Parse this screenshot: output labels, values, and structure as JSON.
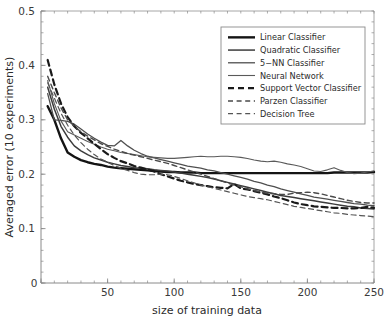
{
  "chart_data": {
    "type": "line",
    "title": "",
    "xlabel": "size of training data",
    "ylabel": "Averaged error (10 experiments)",
    "xlim": [
      0,
      250
    ],
    "ylim": [
      0,
      0.5
    ],
    "xticks": [
      0,
      50,
      100,
      150,
      200,
      250
    ],
    "xticklabels": [
      "0",
      "50",
      "100",
      "150",
      "200",
      "250"
    ],
    "yticks": [
      0,
      0.1,
      0.2,
      0.3,
      0.4,
      0.5
    ],
    "yticklabels": [
      "0",
      "0.1",
      "0.2",
      "0.3",
      "0.4",
      "0.5"
    ],
    "xminor_step": 10,
    "yminor_step": 0.02,
    "grid": false,
    "legend_position": "upper right",
    "colors": {
      "ink": "#1a1a1a",
      "mid_gray": "#4d4d4d",
      "light_gray": "#6e6e6e",
      "frame": "#8a8a8a",
      "background": "#ffffff"
    },
    "x": [
      5,
      10,
      15,
      20,
      25,
      30,
      35,
      40,
      45,
      50,
      55,
      60,
      65,
      70,
      75,
      80,
      85,
      90,
      95,
      100,
      105,
      110,
      115,
      120,
      125,
      130,
      135,
      140,
      145,
      150,
      155,
      160,
      165,
      170,
      175,
      180,
      185,
      190,
      195,
      200,
      205,
      210,
      215,
      220,
      225,
      230,
      235,
      240,
      245,
      250
    ],
    "series": [
      {
        "name": "Linear Classifier",
        "style": "solid",
        "width": 2.4,
        "color": "#141414",
        "values": [
          0.325,
          0.3,
          0.266,
          0.24,
          0.232,
          0.226,
          0.222,
          0.219,
          0.217,
          0.214,
          0.212,
          0.211,
          0.21,
          0.209,
          0.208,
          0.207,
          0.206,
          0.205,
          0.204,
          0.204,
          0.203,
          0.203,
          0.203,
          0.202,
          0.202,
          0.202,
          0.202,
          0.202,
          0.202,
          0.202,
          0.202,
          0.202,
          0.202,
          0.202,
          0.202,
          0.202,
          0.202,
          0.202,
          0.202,
          0.202,
          0.202,
          0.202,
          0.202,
          0.203,
          0.203,
          0.203,
          0.203,
          0.203,
          0.203,
          0.204
        ]
      },
      {
        "name": "Quadratic Classifier",
        "style": "solid",
        "width": 1.5,
        "color": "#3c3c3c",
        "values": [
          0.36,
          0.32,
          0.288,
          0.268,
          0.252,
          0.243,
          0.236,
          0.23,
          0.226,
          0.222,
          0.219,
          0.216,
          0.214,
          0.212,
          0.211,
          0.21,
          0.208,
          0.207,
          0.206,
          0.204,
          0.202,
          0.2,
          0.198,
          0.196,
          0.194,
          0.191,
          0.188,
          0.185,
          0.182,
          0.179,
          0.176,
          0.173,
          0.17,
          0.167,
          0.164,
          0.161,
          0.159,
          0.157,
          0.155,
          0.153,
          0.151,
          0.149,
          0.147,
          0.145,
          0.143,
          0.141,
          0.14,
          0.138,
          0.137,
          0.136
        ]
      },
      {
        "name": "5-NN Classifier",
        "style": "solid",
        "width": 1.3,
        "color": "#4f4f4f",
        "values": [
          0.348,
          0.3,
          0.299,
          0.297,
          0.292,
          0.283,
          0.274,
          0.266,
          0.259,
          0.253,
          0.252,
          0.262,
          0.252,
          0.244,
          0.238,
          0.233,
          0.23,
          0.227,
          0.224,
          0.221,
          0.218,
          0.215,
          0.213,
          0.211,
          0.208,
          0.206,
          0.203,
          0.2,
          0.197,
          0.194,
          0.191,
          0.187,
          0.184,
          0.18,
          0.177,
          0.173,
          0.17,
          0.167,
          0.164,
          0.161,
          0.158,
          0.156,
          0.154,
          0.152,
          0.15,
          0.148,
          0.146,
          0.145,
          0.143,
          0.142
        ]
      },
      {
        "name": "Neural Network",
        "style": "solid",
        "width": 1.1,
        "color": "#5a5a5a",
        "values": [
          0.372,
          0.33,
          0.298,
          0.278,
          0.272,
          0.266,
          0.26,
          0.255,
          0.25,
          0.246,
          0.243,
          0.24,
          0.238,
          0.236,
          0.234,
          0.232,
          0.231,
          0.23,
          0.229,
          0.229,
          0.23,
          0.231,
          0.232,
          0.233,
          0.232,
          0.232,
          0.233,
          0.233,
          0.232,
          0.231,
          0.229,
          0.226,
          0.224,
          0.223,
          0.224,
          0.222,
          0.219,
          0.217,
          0.214,
          0.21,
          0.206,
          0.205,
          0.208,
          0.212,
          0.207,
          0.203,
          0.201,
          0.202,
          0.204,
          0.206
        ]
      },
      {
        "name": "Support Vector Classifier",
        "style": "dashed",
        "width": 2.2,
        "color": "#1a1a1a",
        "values": [
          0.41,
          0.365,
          0.33,
          0.305,
          0.288,
          0.276,
          0.266,
          0.256,
          0.246,
          0.237,
          0.23,
          0.224,
          0.22,
          0.215,
          0.212,
          0.209,
          0.205,
          0.2,
          0.196,
          0.192,
          0.188,
          0.185,
          0.182,
          0.18,
          0.178,
          0.176,
          0.175,
          0.174,
          0.182,
          0.174,
          0.172,
          0.169,
          0.166,
          0.163,
          0.159,
          0.156,
          0.152,
          0.148,
          0.145,
          0.143,
          0.141,
          0.14,
          0.139,
          0.138,
          0.138,
          0.137,
          0.137,
          0.138,
          0.14,
          0.138
        ]
      },
      {
        "name": "Parzen Classifier",
        "style": "dashed",
        "width": 1.4,
        "color": "#4a4a4a",
        "values": [
          0.38,
          0.35,
          0.322,
          0.3,
          0.288,
          0.278,
          0.27,
          0.263,
          0.256,
          0.251,
          0.246,
          0.242,
          0.238,
          0.235,
          0.232,
          0.229,
          0.226,
          0.223,
          0.22,
          0.216,
          0.212,
          0.208,
          0.204,
          0.2,
          0.196,
          0.192,
          0.188,
          0.184,
          0.18,
          0.177,
          0.173,
          0.17,
          0.167,
          0.165,
          0.164,
          0.163,
          0.163,
          0.165,
          0.166,
          0.167,
          0.166,
          0.164,
          0.161,
          0.158,
          0.155,
          0.152,
          0.15,
          0.148,
          0.147,
          0.147
        ]
      },
      {
        "name": "Decision Tree",
        "style": "dashed",
        "width": 1.2,
        "color": "#555555",
        "values": [
          0.368,
          0.34,
          0.312,
          0.29,
          0.272,
          0.258,
          0.246,
          0.236,
          0.228,
          0.222,
          0.216,
          0.211,
          0.207,
          0.203,
          0.2,
          0.199,
          0.199,
          0.2,
          0.199,
          0.196,
          0.192,
          0.188,
          0.184,
          0.18,
          0.177,
          0.174,
          0.171,
          0.168,
          0.165,
          0.162,
          0.159,
          0.157,
          0.155,
          0.153,
          0.15,
          0.147,
          0.144,
          0.141,
          0.139,
          0.137,
          0.135,
          0.133,
          0.131,
          0.129,
          0.128,
          0.126,
          0.125,
          0.124,
          0.123,
          0.122
        ]
      }
    ],
    "legend_entries": [
      {
        "label": "Linear Classifier",
        "style": "solid",
        "width": 2.4,
        "color": "#141414"
      },
      {
        "label": "Quadratic Classifier",
        "style": "solid",
        "width": 1.5,
        "color": "#3c3c3c"
      },
      {
        "label": "5−NN Classifier",
        "style": "solid",
        "width": 1.3,
        "color": "#4f4f4f"
      },
      {
        "label": "Neural Network",
        "style": "solid",
        "width": 1.1,
        "color": "#5a5a5a"
      },
      {
        "label": "Support Vector Classifier",
        "style": "dashed",
        "width": 2.2,
        "color": "#1a1a1a"
      },
      {
        "label": "Parzen Classifier",
        "style": "dashed",
        "width": 1.4,
        "color": "#4a4a4a"
      },
      {
        "label": "Decision Tree",
        "style": "dashed",
        "width": 1.2,
        "color": "#555555"
      }
    ]
  }
}
